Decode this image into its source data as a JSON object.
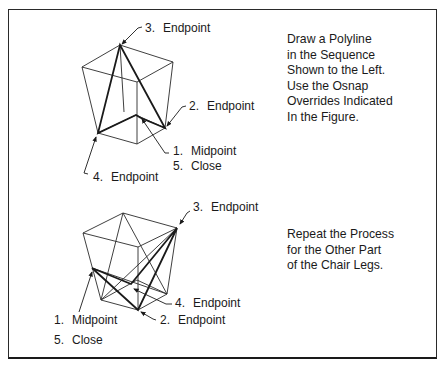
{
  "figure": {
    "top": {
      "instructions": [
        "Draw a Polyline",
        "in the Sequence",
        "Shown to the Left.",
        "Use the Osnap",
        "Overrides Indicated",
        "In the Figure."
      ],
      "labels": [
        {
          "num": "3.",
          "text": "Endpoint"
        },
        {
          "num": "2.",
          "text": "Endpoint"
        },
        {
          "num": "1.",
          "text": "Midpoint"
        },
        {
          "num": "5.",
          "text": "Close"
        },
        {
          "num": "4.",
          "text": "Endpoint"
        }
      ]
    },
    "bottom": {
      "instructions": [
        "Repeat the Process",
        "for the Other Part",
        "of the Chair Legs."
      ],
      "labels": [
        {
          "num": "3.",
          "text": "Endpoint"
        },
        {
          "num": "4.",
          "text": "Endpoint"
        },
        {
          "num": "1.",
          "text": "Midpoint"
        },
        {
          "num": "2.",
          "text": "Endpoint"
        },
        {
          "num": "5.",
          "text": "Close"
        }
      ]
    }
  },
  "colors": {
    "line": "#1a1a1a",
    "background": "#ffffff"
  }
}
